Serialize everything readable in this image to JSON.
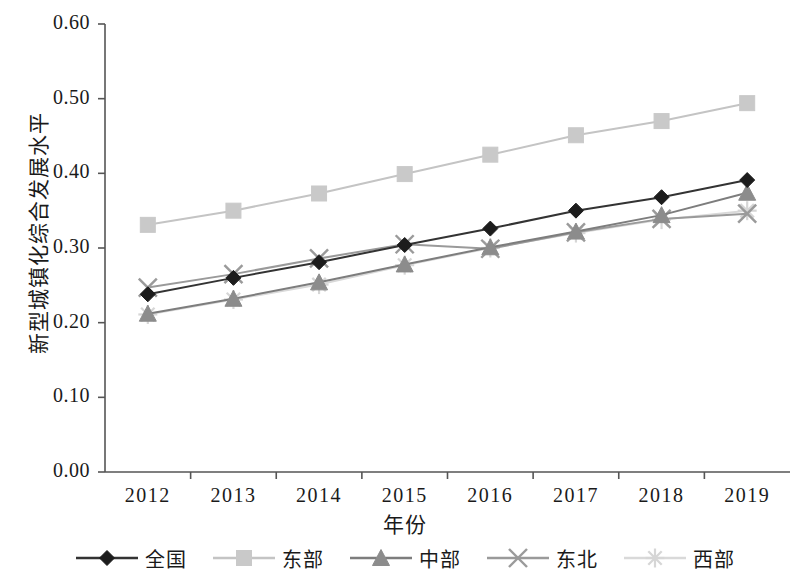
{
  "chart_data": {
    "type": "line",
    "title": "",
    "xlabel": "年份",
    "ylabel": "新型城镇化综合发展水平",
    "x": [
      "2012",
      "2013",
      "2014",
      "2015",
      "2016",
      "2017",
      "2018",
      "2019"
    ],
    "xtick_labels": [
      "2012",
      "2013",
      "2014",
      "2015",
      "2016",
      "2017",
      "2018",
      "2019"
    ],
    "ytick_labels": [
      "0.00",
      "0.10",
      "0.20",
      "0.30",
      "0.40",
      "0.50",
      "0.60"
    ],
    "yticks": [
      0.0,
      0.1,
      0.2,
      0.3,
      0.4,
      0.5,
      0.6
    ],
    "ylim": [
      0.0,
      0.6
    ],
    "grid": false,
    "legend_position": "bottom",
    "series": [
      {
        "name": "全国",
        "marker": "diamond",
        "color": "#1c1c1c",
        "line_color": "#333333",
        "values": [
          0.238,
          0.26,
          0.281,
          0.304,
          0.326,
          0.35,
          0.368,
          0.391
        ]
      },
      {
        "name": "东部",
        "marker": "square",
        "color": "#c9c9c9",
        "line_color": "#c4c4c4",
        "values": [
          0.331,
          0.35,
          0.373,
          0.399,
          0.425,
          0.451,
          0.47,
          0.494
        ]
      },
      {
        "name": "中部",
        "marker": "triangle",
        "color": "#8c8c8c",
        "line_color": "#7d7d7d",
        "values": [
          0.212,
          0.232,
          0.254,
          0.278,
          0.301,
          0.322,
          0.344,
          0.374
        ]
      },
      {
        "name": "东北",
        "marker": "x",
        "color": "#9a9a9a",
        "line_color": "#9a9a9a",
        "values": [
          0.247,
          0.265,
          0.286,
          0.305,
          0.299,
          0.321,
          0.339,
          0.346
        ]
      },
      {
        "name": "西部",
        "marker": "asterisk",
        "color": "#d6d6d6",
        "line_color": "#d9d9d9",
        "values": [
          0.211,
          0.231,
          0.251,
          0.277,
          0.3,
          0.32,
          0.338,
          0.35
        ]
      }
    ]
  },
  "axes": {
    "axis_color": "#555555",
    "plot_left": 105,
    "plot_right": 790,
    "plot_top": 24,
    "plot_bottom": 472
  }
}
